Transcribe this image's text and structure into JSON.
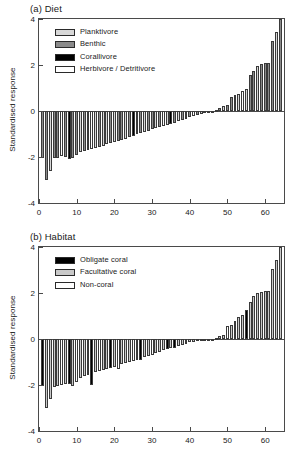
{
  "figure": {
    "ylabel": "Standardised response",
    "yticks": [
      "4",
      "2",
      "0",
      "-2",
      "-4"
    ],
    "ytick_values": [
      4,
      2,
      0,
      -2,
      -4
    ],
    "xticks": [
      "0",
      "10",
      "20",
      "30",
      "40",
      "50",
      "60"
    ],
    "xtick_values": [
      0,
      10,
      20,
      30,
      40,
      50,
      60
    ]
  },
  "panel_a": {
    "title": "(a) Diet",
    "legend": [
      {
        "label": "Planktivore",
        "color": "#d8d8d8"
      },
      {
        "label": "Benthic",
        "color": "#8a8a8a"
      },
      {
        "label": "Corallivore",
        "color": "#000000"
      },
      {
        "label": "Herbivore / Detritivore",
        "color": "#ffffff"
      }
    ]
  },
  "panel_b": {
    "title": "(b) Habitat",
    "legend": [
      {
        "label": "Obligate coral",
        "color": "#000000"
      },
      {
        "label": "Facultative coral",
        "color": "#c9c9c9"
      },
      {
        "label": "Non-coral",
        "color": "#ffffff"
      }
    ]
  },
  "chart_data": [
    {
      "type": "bar",
      "title": "(a) Diet",
      "xlabel": "",
      "ylabel": "Standardised response",
      "xlim": [
        0,
        65
      ],
      "ylim": [
        -4,
        4
      ],
      "grid": false,
      "legend_position": "top-left",
      "categories": [
        1,
        2,
        3,
        4,
        5,
        6,
        7,
        8,
        9,
        10,
        11,
        12,
        13,
        14,
        15,
        16,
        17,
        18,
        19,
        20,
        21,
        22,
        23,
        24,
        25,
        26,
        27,
        28,
        29,
        30,
        31,
        32,
        33,
        34,
        35,
        36,
        37,
        38,
        39,
        40,
        41,
        42,
        43,
        44,
        45,
        46,
        47,
        48,
        49,
        50,
        51,
        52,
        53,
        54,
        55,
        56,
        57,
        58,
        59,
        60,
        61,
        62,
        63,
        64
      ],
      "values": [
        -2.05,
        -3.0,
        -2.6,
        -2.05,
        -2.05,
        -1.95,
        -2.0,
        -2.1,
        -2.05,
        -1.9,
        -1.8,
        -1.75,
        -1.7,
        -1.65,
        -1.6,
        -1.55,
        -1.5,
        -1.45,
        -1.4,
        -1.35,
        -1.3,
        -1.25,
        -1.2,
        -1.15,
        -1.1,
        -1.0,
        -0.95,
        -0.9,
        -0.85,
        -0.8,
        -0.75,
        -0.7,
        -0.65,
        -0.6,
        -0.55,
        -0.5,
        -0.45,
        -0.4,
        -0.33,
        -0.28,
        -0.22,
        -0.16,
        -0.12,
        -0.08,
        -0.05,
        -0.02,
        0.05,
        0.12,
        0.2,
        0.28,
        0.62,
        0.68,
        0.72,
        0.88,
        0.95,
        1.55,
        1.75,
        1.95,
        2.05,
        2.1,
        2.1,
        3.05,
        3.45,
        4.0
      ],
      "colors": [
        "#8a8a8a",
        "#8a8a8a",
        "#d8d8d8",
        "#8a8a8a",
        "#8a8a8a",
        "#ffffff",
        "#8a8a8a",
        "#000000",
        "#8a8a8a",
        "#8a8a8a",
        "#d8d8d8",
        "#8a8a8a",
        "#8a8a8a",
        "#ffffff",
        "#d8d8d8",
        "#8a8a8a",
        "#d8d8d8",
        "#d8d8d8",
        "#8a8a8a",
        "#d8d8d8",
        "#8a8a8a",
        "#8a8a8a",
        "#d8d8d8",
        "#8a8a8a",
        "#000000",
        "#8a8a8a",
        "#8a8a8a",
        "#d8d8d8",
        "#8a8a8a",
        "#8a8a8a",
        "#d8d8d8",
        "#8a8a8a",
        "#ffffff",
        "#d8d8d8",
        "#000000",
        "#8a8a8a",
        "#d8d8d8",
        "#8a8a8a",
        "#d8d8d8",
        "#8a8a8a",
        "#ffffff",
        "#8a8a8a",
        "#d8d8d8",
        "#8a8a8a",
        "#d8d8d8",
        "#8a8a8a",
        "#d8d8d8",
        "#8a8a8a",
        "#d8d8d8",
        "#8a8a8a",
        "#8a8a8a",
        "#8a8a8a",
        "#d8d8d8",
        "#ffffff",
        "#d8d8d8",
        "#8a8a8a",
        "#8a8a8a",
        "#d8d8d8",
        "#8a8a8a",
        "#8a8a8a",
        "#8a8a8a",
        "#8a8a8a",
        "#d8d8d8",
        "#8a8a8a"
      ],
      "series": [
        {
          "name": "Standardised response",
          "values": [
            -2.05,
            -3.0,
            -2.6,
            -2.05,
            -2.05,
            -1.95,
            -2.0,
            -2.1,
            -2.05,
            -1.9,
            -1.8,
            -1.75,
            -1.7,
            -1.65,
            -1.6,
            -1.55,
            -1.5,
            -1.45,
            -1.4,
            -1.35,
            -1.3,
            -1.25,
            -1.2,
            -1.15,
            -1.1,
            -1.0,
            -0.95,
            -0.9,
            -0.85,
            -0.8,
            -0.75,
            -0.7,
            -0.65,
            -0.6,
            -0.55,
            -0.5,
            -0.45,
            -0.4,
            -0.33,
            -0.28,
            -0.22,
            -0.16,
            -0.12,
            -0.08,
            -0.05,
            -0.02,
            0.05,
            0.12,
            0.2,
            0.28,
            0.62,
            0.68,
            0.72,
            0.88,
            0.95,
            1.55,
            1.75,
            1.95,
            2.05,
            2.1,
            2.1,
            3.05,
            3.45,
            4.0
          ]
        }
      ]
    },
    {
      "type": "bar",
      "title": "(b) Habitat",
      "xlabel": "",
      "ylabel": "Standardised response",
      "xlim": [
        0,
        65
      ],
      "ylim": [
        -4,
        4
      ],
      "grid": false,
      "legend_position": "top-left",
      "categories": [
        1,
        2,
        3,
        4,
        5,
        6,
        7,
        8,
        9,
        10,
        11,
        12,
        13,
        14,
        15,
        16,
        17,
        18,
        19,
        20,
        21,
        22,
        23,
        24,
        25,
        26,
        27,
        28,
        29,
        30,
        31,
        32,
        33,
        34,
        35,
        36,
        37,
        38,
        39,
        40,
        41,
        42,
        43,
        44,
        45,
        46,
        47,
        48,
        49,
        50,
        51,
        52,
        53,
        54,
        55,
        56,
        57,
        58,
        59,
        60,
        61,
        62,
        63,
        64
      ],
      "values": [
        -2.05,
        -3.0,
        -2.6,
        -2.1,
        -2.05,
        -2.0,
        -1.95,
        -1.95,
        -2.05,
        -1.85,
        -1.7,
        -1.6,
        -1.55,
        -2.0,
        -1.45,
        -1.4,
        -1.35,
        -1.3,
        -1.25,
        -1.2,
        -1.3,
        -1.1,
        -1.05,
        -1.0,
        -0.95,
        -0.9,
        -0.9,
        -0.8,
        -0.72,
        -0.68,
        -0.62,
        -0.55,
        -0.48,
        -0.42,
        -0.4,
        -0.38,
        -0.3,
        -0.25,
        -0.2,
        -0.15,
        -0.11,
        -0.08,
        -0.05,
        -0.03,
        -0.02,
        -0.01,
        0.05,
        0.12,
        0.18,
        0.55,
        0.62,
        0.78,
        0.95,
        1.05,
        1.25,
        1.6,
        1.85,
        2.0,
        2.05,
        2.1,
        2.1,
        3.05,
        3.45,
        4.0
      ],
      "colors": [
        "#000000",
        "#c9c9c9",
        "#c9c9c9",
        "#c9c9c9",
        "#c9c9c9",
        "#ffffff",
        "#c9c9c9",
        "#000000",
        "#c9c9c9",
        "#ffffff",
        "#c9c9c9",
        "#c9c9c9",
        "#c9c9c9",
        "#000000",
        "#c9c9c9",
        "#ffffff",
        "#c9c9c9",
        "#c9c9c9",
        "#000000",
        "#c9c9c9",
        "#ffffff",
        "#c9c9c9",
        "#c9c9c9",
        "#c9c9c9",
        "#ffffff",
        "#c9c9c9",
        "#000000",
        "#c9c9c9",
        "#c9c9c9",
        "#ffffff",
        "#c9c9c9",
        "#c9c9c9",
        "#c9c9c9",
        "#000000",
        "#c9c9c9",
        "#000000",
        "#c9c9c9",
        "#c9c9c9",
        "#ffffff",
        "#c9c9c9",
        "#c9c9c9",
        "#c9c9c9",
        "#ffffff",
        "#c9c9c9",
        "#c9c9c9",
        "#c9c9c9",
        "#c9c9c9",
        "#c9c9c9",
        "#c9c9c9",
        "#ffffff",
        "#c9c9c9",
        "#c9c9c9",
        "#c9c9c9",
        "#c9c9c9",
        "#000000",
        "#c9c9c9",
        "#c9c9c9",
        "#c9c9c9",
        "#c9c9c9",
        "#c9c9c9",
        "#c9c9c9",
        "#c9c9c9",
        "#c9c9c9",
        "#c9c9c9"
      ],
      "series": [
        {
          "name": "Standardised response",
          "values": [
            -2.05,
            -3.0,
            -2.6,
            -2.1,
            -2.05,
            -2.0,
            -1.95,
            -1.95,
            -2.05,
            -1.85,
            -1.7,
            -1.6,
            -1.55,
            -2.0,
            -1.45,
            -1.4,
            -1.35,
            -1.3,
            -1.25,
            -1.2,
            -1.3,
            -1.1,
            -1.05,
            -1.0,
            -0.95,
            -0.9,
            -0.9,
            -0.8,
            -0.72,
            -0.68,
            -0.62,
            -0.55,
            -0.48,
            -0.42,
            -0.4,
            -0.38,
            -0.3,
            -0.25,
            -0.2,
            -0.15,
            -0.11,
            -0.08,
            -0.05,
            -0.03,
            -0.02,
            -0.01,
            0.05,
            0.12,
            0.18,
            0.55,
            0.62,
            0.78,
            0.95,
            1.05,
            1.25,
            1.6,
            1.85,
            2.0,
            2.05,
            2.1,
            2.1,
            3.05,
            3.45,
            4.0
          ]
        }
      ]
    }
  ]
}
